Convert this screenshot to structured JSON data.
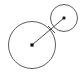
{
  "figure": {
    "canvas": {
      "width": 83,
      "height": 77
    },
    "background_color": "#ffffff",
    "stroke_color": "#4a4a4a",
    "connector_color": "#3a3a3a",
    "dot_color": "#111111"
  },
  "chart_data": {
    "type": "scatter",
    "xlabel": "",
    "ylabel": "",
    "xlim": [
      0,
      83
    ],
    "ylim": [
      0,
      77
    ],
    "grid": false,
    "legend": "none",
    "shapes": [
      {
        "name": "large-circle",
        "kind": "circle",
        "cx": 32,
        "cy": 45,
        "r": 23.5,
        "stroke": "#4a4a4a",
        "stroke_width": 0.9,
        "fill": "none"
      },
      {
        "name": "small-circle",
        "kind": "circle",
        "cx": 64,
        "cy": 18,
        "r": 13.5,
        "stroke": "#4a4a4a",
        "stroke_width": 0.9,
        "fill": "none"
      },
      {
        "name": "center-connector",
        "kind": "line",
        "x1": 32,
        "y1": 45,
        "x2": 64,
        "y2": 18,
        "stroke": "#3a3a3a",
        "stroke_width": 0.9
      },
      {
        "name": "connector-overshoot",
        "kind": "line",
        "x1": 55,
        "y1": 33,
        "x2": 48,
        "y2": 26,
        "stroke": "#3a3a3a",
        "stroke_width": 0.8
      }
    ],
    "points": [
      {
        "name": "large-circle-center",
        "x": 32,
        "y": 45,
        "marker": "square-dot",
        "size": 3.2,
        "color": "#111111"
      },
      {
        "name": "small-circle-center",
        "x": 64,
        "y": 18,
        "marker": "square-dot",
        "size": 2.8,
        "color": "#111111"
      }
    ],
    "annotations": []
  }
}
